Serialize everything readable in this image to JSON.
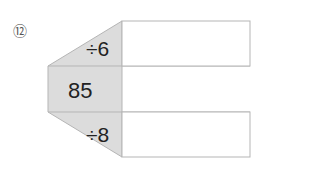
{
  "problem": {
    "number": "⑫",
    "center_value": "85",
    "top_operation": "÷6",
    "bottom_operation": "÷8",
    "top_answer": "",
    "bottom_answer": ""
  },
  "colors": {
    "shape_fill": "#dcdcdc",
    "border": "#b5b5b5"
  }
}
